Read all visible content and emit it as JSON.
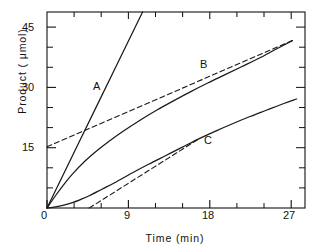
{
  "chart_data": {
    "type": "line",
    "title": "",
    "xlabel": "Time  (min)",
    "ylabel": "Product  ( μmol)",
    "xlim": [
      0,
      30.5
    ],
    "ylim": [
      0,
      48
    ],
    "grid": false,
    "legend_position": "inline-curve-labels",
    "x_major_ticks": [
      0,
      9,
      18,
      27
    ],
    "x_major_tick_labels": [
      "0",
      "9",
      "18",
      "27"
    ],
    "x_minor_ticks": [
      3,
      6,
      12,
      15,
      21,
      24,
      30
    ],
    "y_major_ticks": [
      15,
      30,
      45
    ],
    "y_major_tick_labels": [
      "15",
      "30",
      "45"
    ],
    "y_minor_ticks": [
      5,
      10,
      20,
      25,
      35,
      40
    ],
    "y_zero_tick_label": "0",
    "tick_direction": "in",
    "frame": "box",
    "series": [
      {
        "name": "A",
        "label": "A",
        "style": "solid",
        "description": "Steep straight line through origin, leaves top of plot",
        "x": [
          0,
          2,
          4,
          6,
          8,
          10,
          11.3
        ],
        "y": [
          0,
          8.5,
          17,
          25.5,
          34,
          42.5,
          48
        ]
      },
      {
        "name": "B",
        "label": "B",
        "style": "solid",
        "description": "Curve with downward curvature (burst) approaching linear steady state",
        "x": [
          0,
          1,
          2,
          3,
          4.5,
          6,
          7.5,
          9,
          11,
          13,
          15,
          17,
          19,
          21,
          23,
          25,
          27,
          29
        ],
        "y": [
          0,
          3.0,
          5.8,
          8.3,
          11.5,
          14.2,
          16.6,
          18.8,
          21.5,
          24.0,
          26.3,
          28.5,
          30.6,
          32.6,
          34.6,
          36.6,
          38.8,
          41.0
        ]
      },
      {
        "name": "B-extrapolation",
        "label": "",
        "style": "dashed",
        "description": "Dashed extrapolation of steady-state phase of B back to y-axis; y-intercept 15 μmol",
        "x": [
          0,
          29
        ],
        "y": [
          15,
          41.0
        ]
      },
      {
        "name": "C",
        "label": "C",
        "style": "solid",
        "description": "Curve with lag phase then linear steady state",
        "x": [
          0,
          1,
          2,
          3,
          4,
          5,
          6.5,
          8,
          10,
          12,
          14,
          16,
          18,
          20,
          22,
          24,
          26,
          28,
          29.5
        ],
        "y": [
          0,
          0.25,
          0.7,
          1.3,
          2.1,
          3.0,
          4.6,
          6.2,
          8.5,
          10.7,
          12.8,
          14.9,
          17.0,
          18.9,
          20.7,
          22.4,
          24.0,
          25.6,
          26.7
        ]
      },
      {
        "name": "C-extrapolation",
        "label": "",
        "style": "dashed",
        "description": "Dashed extrapolation of steady-state phase of C back to x-axis; lag (x-intercept) about 5 min",
        "x": [
          5.0,
          18
        ],
        "y": [
          0,
          17.0
        ]
      }
    ]
  },
  "curve_labels": [
    {
      "text": "A",
      "x": 93,
      "y": 80
    },
    {
      "text": "B",
      "x": 200,
      "y": 58
    },
    {
      "text": "C",
      "x": 204,
      "y": 134
    }
  ],
  "x_tick_labels": [
    {
      "text": "0",
      "x": 44
    },
    {
      "text": "9",
      "x": 124
    },
    {
      "text": "18",
      "x": 205
    },
    {
      "text": "27",
      "x": 285
    }
  ],
  "y_tick_labels": [
    {
      "text": "45",
      "y": 22
    },
    {
      "text": "30",
      "y": 82
    },
    {
      "text": "15",
      "y": 142
    },
    {
      "text": "0",
      "y": 210
    }
  ],
  "axis_titles": {
    "x": "Time  (min)",
    "y": "Product  ( μmol)"
  },
  "colors": {
    "ink": "#111111",
    "background": "#ffffff",
    "curve": "#1a1a1a"
  }
}
